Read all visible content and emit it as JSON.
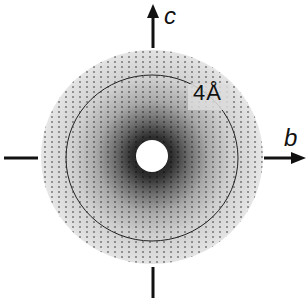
{
  "figure": {
    "type": "diffraction-pattern",
    "axes": {
      "vertical": {
        "label": "c",
        "direction": "up"
      },
      "horizontal": {
        "label": "b",
        "direction": "right"
      }
    },
    "resolution_ring": {
      "label": "4Å"
    },
    "colors": {
      "background": "#ffffff",
      "disc_outer": "#e6e6e6",
      "disc_inner": "#2a2a2a",
      "ring": "#222222",
      "axis": "#111111"
    }
  }
}
